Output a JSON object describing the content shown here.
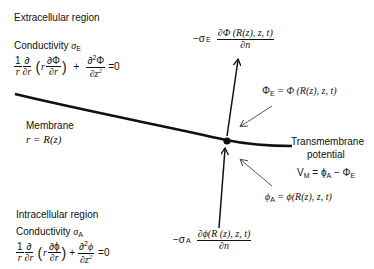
{
  "extracellular": {
    "title": "Extracellular region",
    "conductivity_label": "Conductivity",
    "sigma": "σ",
    "sigma_sub": "E",
    "laplace": {
      "one": "1",
      "r": "r",
      "d": "∂",
      "dr": "∂r",
      "dPhi": "∂Φ",
      "d2Phi": "∂",
      "Phi": "Φ",
      "dz2": "∂z",
      "two": "2",
      "plus": "+",
      "eq": "=0"
    }
  },
  "membrane": {
    "title": "Membrane",
    "equation": "r = R(z)"
  },
  "intracellular": {
    "title": "Intracellular region",
    "conductivity_label": "Conductivity",
    "sigma": "σ",
    "sigma_sub": "A",
    "laplace": {
      "one": "1",
      "r": "r",
      "dr": "∂r",
      "dphi": "∂ϕ",
      "phi": "ϕ",
      "dz2": "∂z",
      "two": "2",
      "plus": "+",
      "eq": "=0"
    }
  },
  "flux_top": {
    "prefix": "−σ",
    "sub": "E",
    "numerator": "∂Φ (R(z), z, t)",
    "denominator": "∂n"
  },
  "flux_bottom": {
    "prefix": "−σ",
    "sub": "A",
    "numerator": "∂ϕ(R (z), z, t)",
    "denominator": "∂n"
  },
  "phi_E": {
    "lhs": "Φ",
    "sub": "E",
    "rhs": " = Φ (R(z), z, t)"
  },
  "phi_A": {
    "lhs": "ϕ",
    "sub": "A",
    "rhs": " = ϕ(R(z), z, t)"
  },
  "transmembrane": {
    "line1": "Transmembrane",
    "line2": "potential",
    "vm": "V",
    "vm_sub": "M",
    "eq": " = ϕ",
    "a_sub": "A",
    "minus": " − Φ",
    "e_sub": "E"
  },
  "colors": {
    "line": "#111111",
    "pointer": "#444444",
    "background": "#ffffff"
  }
}
